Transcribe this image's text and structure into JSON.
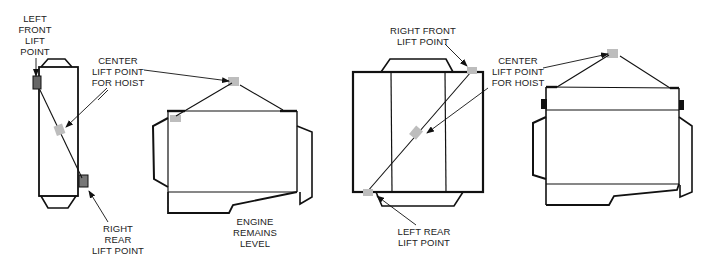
{
  "figure": {
    "colors": {
      "outline": "#111111",
      "lift_point_fill": "#bdbdbd",
      "tab_fill": "#555555",
      "text": "#222222",
      "background": "#ffffff"
    }
  },
  "views": [
    {
      "id": "view-1-top-narrow",
      "labels": {
        "left_front": "LEFT\nFRONT\nLIFT\nPOINT",
        "center": "CENTER\nLIFT POINT\nFOR HOIST",
        "right_rear": "RIGHT\nREAR\nLIFT POINT"
      }
    },
    {
      "id": "view-2-side",
      "labels": {
        "engine_level": "ENGINE\nREMAINS\nLEVEL"
      }
    },
    {
      "id": "view-3-top-wide",
      "labels": {
        "right_front": "RIGHT FRONT\nLIFT POINT",
        "center": "CENTER\nLIFT POINT\nFOR HOIST",
        "left_rear": "LEFT REAR\nLIFT POINT"
      }
    },
    {
      "id": "view-4-side",
      "labels": {}
    }
  ]
}
